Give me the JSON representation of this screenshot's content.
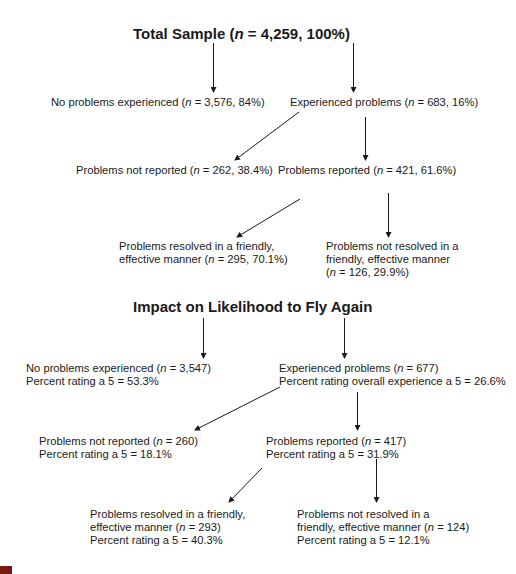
{
  "section1": {
    "title_pre": "Total Sample (",
    "title_n": "n",
    "title_post": " = 4,259, 100%)",
    "nodes": {
      "no_problems": {
        "pre": "No problems experienced (",
        "n": "n",
        "post": " = 3,576, 84%)"
      },
      "experienced": {
        "pre": "Experienced problems (",
        "n": "n",
        "post": " = 683, 16%)"
      },
      "not_reported": {
        "pre": "Problems not reported (",
        "n": "n",
        "post": " = 262, 38.4%)"
      },
      "reported": {
        "pre": "Problems reported (",
        "n": "n",
        "post": " = 421, 61.6%)"
      },
      "resolved": {
        "line1": "Problems resolved in a friendly,",
        "line2_pre": "effective manner (",
        "n": "n",
        "line2_post": " = 295, 70.1%)"
      },
      "not_resolved": {
        "line1": "Problems not resolved in a",
        "line2": "friendly, effective manner",
        "line3_pre": " (",
        "n": "n",
        "line3_post": " = 126, 29.9%)"
      }
    }
  },
  "section2": {
    "title": "Impact on Likelihood to Fly Again",
    "nodes": {
      "no_problems": {
        "pre": "No problems experienced (",
        "n": "n",
        "post": " = 3,547)",
        "rating": "Percent rating a 5 = 53.3%"
      },
      "experienced": {
        "pre": "Experienced problems (",
        "n": "n",
        "post": " = 677)",
        "rating": "Percent rating overall experience a 5 = 26.6%"
      },
      "not_reported": {
        "pre": "Problems not reported (",
        "n": "n",
        "post": " = 260)",
        "rating": "Percent rating a 5 = 18.1%"
      },
      "reported": {
        "pre": "Problems reported (",
        "n": "n",
        "post": " = 417)",
        "rating": "Percent rating a 5 = 31.9%"
      },
      "resolved": {
        "line1": "Problems resolved in a friendly,",
        "line2_pre": "effective manner (",
        "n": "n",
        "line2_post": " = 293)",
        "rating": "Percent rating a 5 = 40.3%"
      },
      "not_resolved": {
        "line1": "Problems not resolved in a",
        "line2_pre": "friendly, effective manner (",
        "n": "n",
        "line2_post": " = 124)",
        "rating": "Percent rating a 5 = 12.1%"
      }
    }
  },
  "colors": {
    "text": "#1a1a1a",
    "arrow": "#1a1a1a",
    "corner_mark": "#7a1a10"
  }
}
